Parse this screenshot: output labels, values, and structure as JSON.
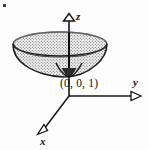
{
  "figure": {
    "kind": "3d-coordinate-sketch",
    "title": "",
    "background_color": "#fdfdfd",
    "ink_color": "#151515",
    "stipple_color": "#555555",
    "surface_fill": "#f2f2f2"
  },
  "axes": {
    "z": {
      "label": "z",
      "direction": "up",
      "arrowhead": "open-triangle",
      "tip": {
        "x": 69,
        "y": 14
      },
      "origin": {
        "x": 69,
        "y": 96
      }
    },
    "y": {
      "label": "y",
      "direction": "right",
      "arrowhead": "open-triangle",
      "tip": {
        "x": 141,
        "y": 96
      },
      "origin": {
        "x": 69,
        "y": 96
      }
    },
    "x": {
      "label": "x",
      "direction": "down-left",
      "arrowhead": "open-triangle",
      "tip": {
        "x": 40,
        "y": 131
      },
      "origin": {
        "x": 69,
        "y": 96
      }
    }
  },
  "annotations": [
    {
      "name": "vertex-point-label",
      "text": "(0, 0, 1)",
      "x": 60,
      "y": 78
    }
  ],
  "surface": {
    "name": "paraboloid",
    "rim_ellipse": {
      "cx": 60,
      "cy": 44,
      "rx": 47,
      "ry": 12
    },
    "vertex": {
      "x": 69,
      "y": 76
    },
    "fill_pattern": "stipple-dots",
    "outline_width": 1.2
  },
  "marks": {
    "corner_speck": {
      "x": 3,
      "y": 4,
      "size": 3
    }
  }
}
